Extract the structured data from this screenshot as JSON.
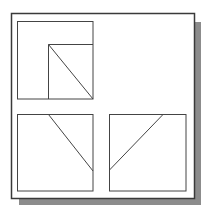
{
  "diagram": {
    "type": "orthographic-projection",
    "views": [
      {
        "name": "top-view",
        "position": "upper-left"
      },
      {
        "name": "front-view",
        "position": "lower-left"
      },
      {
        "name": "side-view",
        "position": "lower-right"
      }
    ],
    "colors": {
      "background": "#ffffff",
      "frame": "#3c3c3c",
      "shadow": "#8a8a8a",
      "lines": "#404040"
    }
  }
}
